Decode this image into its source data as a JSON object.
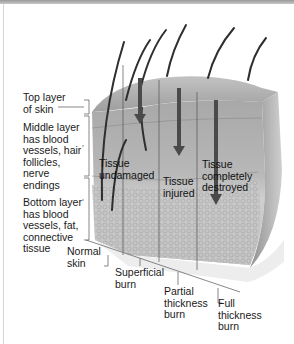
{
  "figure": {
    "layer_labels": [
      {
        "id": "top",
        "text": "Top layer\nof skin"
      },
      {
        "id": "middle",
        "text": "Middle layer\nhas blood\nvessels, hair\nfollicles,\nnerve\nendings"
      },
      {
        "id": "bottom",
        "text": "Bottom layer\nhas blood\nvessels, fat,\nconnective\ntissue"
      }
    ],
    "region_labels": [
      {
        "id": "undamaged",
        "text": "Tissue\nundamaged"
      },
      {
        "id": "injured",
        "text": "Tissue\ninjured"
      },
      {
        "id": "destroyed",
        "text": "Tissue\ncompletely\ndestroyed"
      }
    ],
    "burn_labels": [
      {
        "id": "normal",
        "text": "Normal\nskin"
      },
      {
        "id": "superficial",
        "text": "Superficial\nburn"
      },
      {
        "id": "partial",
        "text": "Partial\nthickness\nburn"
      },
      {
        "id": "full",
        "text": "Full\nthickness\nburn"
      }
    ],
    "colors": {
      "skin_top": "#a9a9a9",
      "skin_mid": "#b9b9b9",
      "skin_bottom": "#c4c4c4",
      "hair": "#3a3a3a",
      "arrow": "#4a4a4a",
      "leader": "#555555"
    }
  }
}
